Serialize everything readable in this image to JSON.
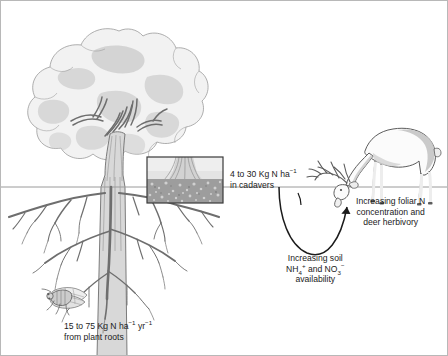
{
  "figure": {
    "name": "nitrogen-cycling-diagram",
    "background_color": "#ffffff",
    "border_color": "#b8b8b8",
    "text_color": "#1b1b1b"
  },
  "labels": {
    "cadavers": {
      "line1_pre": "4 to 30 Kg N ha",
      "line1_sup": "−1",
      "line2": "in cadavers"
    },
    "roots": {
      "line1_pre": "15 to 75 Kg N ha",
      "line1_sup1": "−1",
      "line1_mid": " yr",
      "line1_sup2": "−1",
      "line2": "from plant roots"
    },
    "soil": {
      "line1": "Increasing soil",
      "line2_pre": "NH",
      "line2_sub1": "4",
      "line2_sup1": "+",
      "line2_mid": " and NO",
      "line2_sub2": "3",
      "line2_sup2": "−",
      "line3": "availability"
    },
    "foliar": {
      "line1": "Increasing foliar N",
      "line2": "concentration and",
      "line3": "deer herbivory"
    }
  },
  "elements": {
    "tree": "deciduous-tree-with-canopy",
    "roots": "tree-root-system",
    "cicada": "cicada-insect",
    "deer": "grazing-deer",
    "inset": "soil-cross-section-photo",
    "arrow_curved": "curved-arrow-soil-to-deer",
    "arrow_cadaver": "arrow-cadavers-to-soil"
  },
  "colors": {
    "canopy_fill": "#f2f2f2",
    "canopy_shade": "#cfcfcf",
    "canopy_outline": "#9a9a9a",
    "trunk_fill": "#d8d8d8",
    "trunk_outline": "#6e6e6e",
    "root_stroke": "#6e6e6e",
    "ground_line": "#9a9a9a",
    "deer_fill": "#fbfbfb",
    "deer_shade": "#c4c4c4",
    "deer_outline": "#5c5c5c",
    "inset_border": "#3a3a3a",
    "inset_sky": "#e4e4e4",
    "inset_soil": "#9d9d9d",
    "arrow_stroke": "#1b1b1b"
  }
}
